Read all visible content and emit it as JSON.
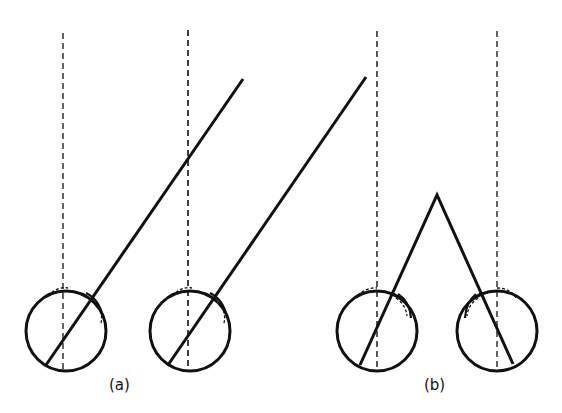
{
  "figure": {
    "panels": [
      {
        "label": "(a)",
        "description": "Both eyes looking parallel to the upper right"
      },
      {
        "label": "(b)",
        "description": "Both eyes converging on a near point"
      }
    ],
    "colors": {
      "stroke": "#111111",
      "background": "#ffffff"
    }
  }
}
